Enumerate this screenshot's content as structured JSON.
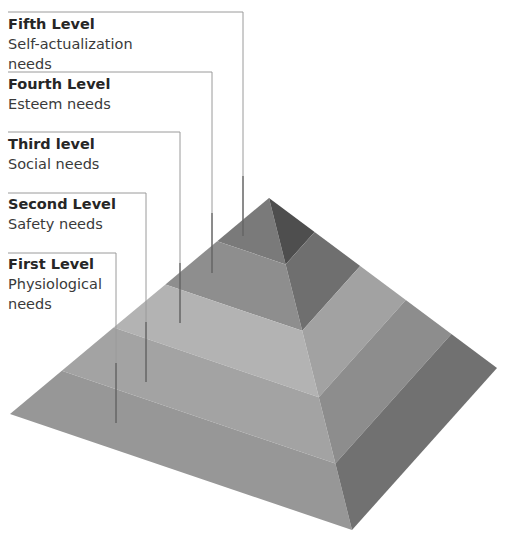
{
  "diagram": {
    "type": "pyramid",
    "levels": [
      {
        "id": "fifth",
        "title": "Fifth Level",
        "desc_lines": [
          "Self-actualization",
          "needs"
        ],
        "left_color": "#7a7a7a",
        "right_color": "#4e4e4e",
        "label_top": 14,
        "line_y": 12,
        "line_x": 243,
        "line_end_y": 236
      },
      {
        "id": "fourth",
        "title": "Fourth Level",
        "desc_lines": [
          "Esteem needs"
        ],
        "left_color": "#8e8e8e",
        "right_color": "#6f6f6f",
        "label_top": 74,
        "line_y": 72,
        "line_x": 212,
        "line_end_y": 273
      },
      {
        "id": "third",
        "title": "Third level",
        "desc_lines": [
          "Social needs"
        ],
        "left_color": "#b3b3b3",
        "right_color": "#a2a2a2",
        "label_top": 134,
        "line_y": 132,
        "line_x": 180,
        "line_end_y": 323
      },
      {
        "id": "second",
        "title": "Second Level",
        "desc_lines": [
          "Safety needs"
        ],
        "left_color": "#a3a3a3",
        "right_color": "#8d8d8d",
        "label_top": 194,
        "line_y": 193,
        "line_x": 146,
        "line_end_y": 382
      },
      {
        "id": "first",
        "title": "First Level",
        "desc_lines": [
          "Physiological",
          "needs"
        ],
        "left_color": "#979797",
        "right_color": "#717171",
        "label_top": 254,
        "line_y": 253,
        "line_x": 116,
        "line_end_y": 423
      }
    ],
    "geometry": {
      "apex": [
        269,
        198
      ],
      "left_corner": [
        10,
        414
      ],
      "front_corner": [
        352,
        530
      ],
      "right_corner": [
        497,
        368
      ]
    },
    "leader_line_color": "#9a9a9a"
  }
}
